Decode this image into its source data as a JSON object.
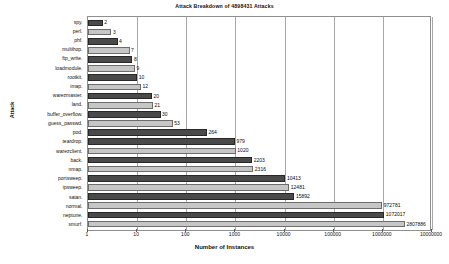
{
  "chart_data": {
    "type": "bar",
    "orientation": "horizontal",
    "title": "Attack Breakdown of 4898431 Attacks",
    "xlabel": "Number of Instances",
    "ylabel": "Attack",
    "xscale": "log",
    "xlim": [
      1,
      10000000
    ],
    "grid": true,
    "legend": "none",
    "xticks": [
      "1",
      "10",
      "100",
      "1000",
      "10000",
      "100000",
      "1000000",
      "10000000"
    ],
    "xtick_values": [
      1,
      10,
      100,
      1000,
      10000,
      100000,
      1000000,
      10000000
    ],
    "categories": [
      "spy.",
      "perl.",
      "phf.",
      "multihop.",
      "ftp_write.",
      "loadmodule.",
      "rootkit.",
      "imap.",
      "warezmaster.",
      "land.",
      "buffer_overflow.",
      "guess_passwd.",
      "pod.",
      "teardrop.",
      "warezclient.",
      "back.",
      "nmap.",
      "portsweep.",
      "ipsweep.",
      "satan.",
      "normal.",
      "neptune.",
      "smurf."
    ],
    "values": [
      2,
      3,
      4,
      7,
      8,
      9,
      10,
      12,
      20,
      21,
      30,
      53,
      264,
      979,
      1020,
      2203,
      2316,
      10413,
      12481,
      15892,
      972781,
      1072017,
      2807886
    ],
    "value_labels": [
      "2",
      "3",
      "4",
      "7",
      "8",
      "9",
      "10",
      "12",
      "20",
      "21",
      "30",
      "53",
      "264",
      "979",
      "1020",
      "2203",
      "2316",
      "10413",
      "12481",
      "15892",
      "972781",
      "1072017",
      "2807886"
    ],
    "bar_styles": [
      "dark",
      "light",
      "dark",
      "light",
      "dark",
      "light",
      "dark",
      "light",
      "dark",
      "light",
      "dark",
      "light",
      "dark",
      "dark",
      "light",
      "dark",
      "light",
      "dark",
      "light",
      "dark",
      "light",
      "dark",
      "light"
    ],
    "colors": {
      "bar_dark": "#4a4a4a",
      "bar_light": "#c6c6c6",
      "grid": "#a8a8a8",
      "frame": "#8f8f8f",
      "text": "#101010",
      "background": "#ffffff"
    }
  }
}
